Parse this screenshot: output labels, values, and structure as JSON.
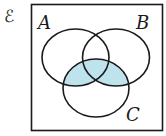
{
  "diagram": {
    "type": "venn",
    "universal_set_symbol": "ℰ",
    "sets": [
      {
        "label": "A",
        "cx": 75.5,
        "cy": 57.5,
        "rx": 33.5,
        "ry": 28.5
      },
      {
        "label": "B",
        "cx": 116,
        "cy": 57.5,
        "rx": 33.5,
        "ry": 28.5
      },
      {
        "label": "C",
        "cx": 96,
        "cy": 88,
        "rx": 33,
        "ry": 29
      }
    ],
    "shaded_region": "(A ∪ B) ∩ C",
    "colors": {
      "shade": "#bfe3ec",
      "stroke": "#1a1a1a",
      "frame": "#1a1a1a",
      "background": "#ffffff"
    },
    "labels": {
      "universal": "ℰ",
      "a": "A",
      "b": "B",
      "c": "C"
    }
  }
}
